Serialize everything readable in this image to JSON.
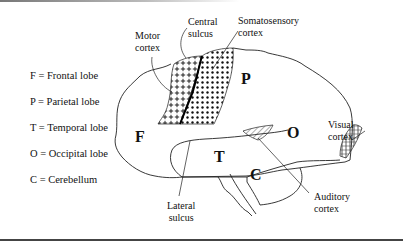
{
  "legend": [
    {
      "key": "F",
      "text": "F = Frontal lobe"
    },
    {
      "key": "P",
      "text": "P = Parietal lobe"
    },
    {
      "key": "T",
      "text": "T = Temporal lobe"
    },
    {
      "key": "O",
      "text": "O = Occipital lobe"
    },
    {
      "key": "C",
      "text": "C = Cerebellum"
    }
  ],
  "lobes": {
    "frontal": "F",
    "parietal": "P",
    "temporal": "T",
    "occipital": "O",
    "cerebellum": "C"
  },
  "callouts": {
    "motor_cortex": [
      "Motor",
      "cortex"
    ],
    "central_sulcus": [
      "Central",
      "sulcus"
    ],
    "somatosensory_cortex": [
      "Somatosensory",
      "cortex"
    ],
    "visual_cortex": [
      "Visual",
      "cortex"
    ],
    "auditory_cortex": [
      "Auditory",
      "cortex"
    ],
    "lateral_sulcus": [
      "Lateral",
      "sulcus"
    ]
  }
}
